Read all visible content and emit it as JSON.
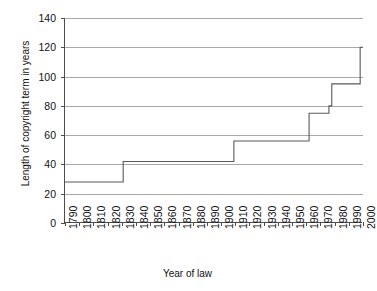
{
  "chart_data": {
    "type": "line",
    "title": "",
    "xlabel": "Year of law",
    "ylabel": "Length of copyright term in years",
    "xlim": [
      1790,
      2000
    ],
    "ylim": [
      0,
      140
    ],
    "grid": true,
    "legend": false,
    "y_ticks": [
      0,
      20,
      40,
      60,
      80,
      100,
      120,
      140
    ],
    "x_ticks": [
      1790,
      1800,
      1810,
      1820,
      1830,
      1840,
      1850,
      1860,
      1870,
      1880,
      1890,
      1900,
      1910,
      1920,
      1930,
      1940,
      1950,
      1960,
      1970,
      1980,
      1990,
      2000
    ],
    "line_color": "#595959",
    "series": [
      {
        "name": "Length of copyright term",
        "x": [
          1790,
          1831,
          1831,
          1909,
          1909,
          1962,
          1962,
          1976,
          1976,
          1978,
          1978,
          1998,
          1998,
          2000
        ],
        "values": [
          28,
          28,
          42,
          42,
          56,
          56,
          75,
          75,
          80,
          80,
          95,
          95,
          120,
          120
        ]
      }
    ],
    "steps": [
      {
        "year": 1790,
        "term": 28
      },
      {
        "year": 1831,
        "term": 42
      },
      {
        "year": 1909,
        "term": 56
      },
      {
        "year": 1962,
        "term": 75
      },
      {
        "year": 1978,
        "term": 95
      },
      {
        "year": 1998,
        "term": 120
      }
    ]
  }
}
